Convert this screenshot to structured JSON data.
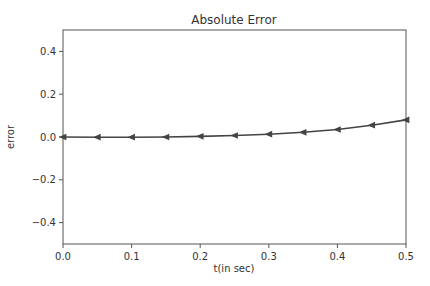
{
  "chart_data": {
    "type": "line",
    "title": "Absolute Error",
    "xlabel": "t(in sec)",
    "ylabel": "error",
    "xlim": [
      0.0,
      0.5
    ],
    "ylim": [
      -0.5,
      0.5
    ],
    "grid": false,
    "legend": null,
    "x_ticks": [
      "0.0",
      "0.1",
      "0.2",
      "0.3",
      "0.4",
      "0.5"
    ],
    "y_ticks": [
      "−0.4",
      "−0.2",
      "0.0",
      "0.2",
      "0.4"
    ],
    "series": [
      {
        "name": "error",
        "marker": "triangle-left",
        "color": "#444444",
        "x": [
          0.0,
          0.05,
          0.1,
          0.15,
          0.2,
          0.25,
          0.3,
          0.35,
          0.4,
          0.45,
          0.5
        ],
        "values": [
          0.0,
          -0.001,
          -0.001,
          0.0,
          0.003,
          0.007,
          0.013,
          0.022,
          0.035,
          0.055,
          0.08
        ]
      }
    ]
  }
}
